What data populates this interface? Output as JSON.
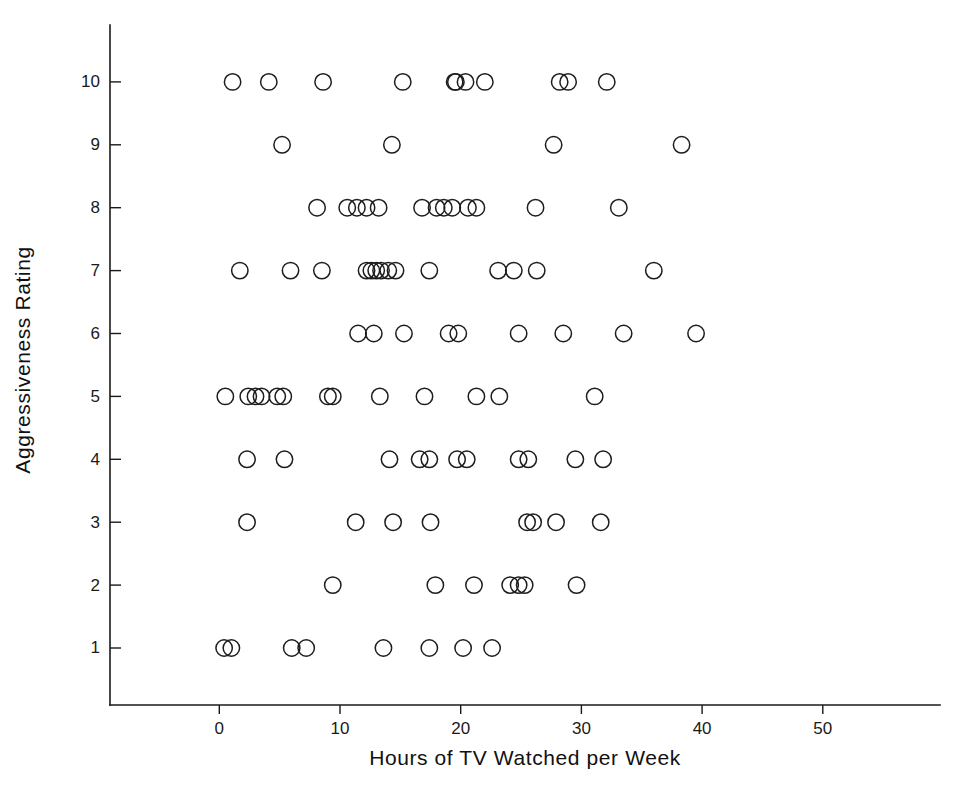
{
  "chart_data": {
    "type": "scatter",
    "title": "",
    "xlabel": "Hours of TV Watched per Week",
    "ylabel": "Aggressiveness Rating",
    "xlim": [
      -5,
      58
    ],
    "ylim": [
      0.2,
      11.2
    ],
    "grid": false,
    "legend": null,
    "marker": "open-circle",
    "marker_color": "#1d1d1d",
    "xticks": [
      0,
      10,
      20,
      30,
      40,
      50
    ],
    "xtick_labels": [
      "0",
      "10",
      "20",
      "30",
      "40",
      "50"
    ],
    "yticks": [
      1,
      2,
      3,
      4,
      5,
      6,
      7,
      8,
      9,
      10
    ],
    "ytick_labels": [
      "1",
      "2",
      "3",
      "4",
      "5",
      "6",
      "7",
      "8",
      "9",
      "10"
    ],
    "series": [
      {
        "name": "participants",
        "points": [
          [
            1.1,
            10
          ],
          [
            4.1,
            10
          ],
          [
            8.6,
            10
          ],
          [
            15.2,
            10
          ],
          [
            19.5,
            10
          ],
          [
            19.6,
            10
          ],
          [
            20.4,
            10
          ],
          [
            22.0,
            10
          ],
          [
            28.2,
            10
          ],
          [
            28.9,
            10
          ],
          [
            32.1,
            10
          ],
          [
            5.2,
            9
          ],
          [
            14.3,
            9
          ],
          [
            27.7,
            9
          ],
          [
            38.3,
            9
          ],
          [
            8.1,
            8
          ],
          [
            10.6,
            8
          ],
          [
            11.4,
            8
          ],
          [
            12.2,
            8
          ],
          [
            13.2,
            8
          ],
          [
            16.8,
            8
          ],
          [
            18.0,
            8
          ],
          [
            18.6,
            8
          ],
          [
            19.3,
            8
          ],
          [
            20.6,
            8
          ],
          [
            21.3,
            8
          ],
          [
            26.2,
            8
          ],
          [
            33.1,
            8
          ],
          [
            1.7,
            7
          ],
          [
            5.9,
            7
          ],
          [
            8.5,
            7
          ],
          [
            12.2,
            7
          ],
          [
            12.6,
            7
          ],
          [
            13.0,
            7
          ],
          [
            13.4,
            7
          ],
          [
            14.0,
            7
          ],
          [
            14.6,
            7
          ],
          [
            17.4,
            7
          ],
          [
            23.1,
            7
          ],
          [
            24.4,
            7
          ],
          [
            26.3,
            7
          ],
          [
            36.0,
            7
          ],
          [
            11.5,
            6
          ],
          [
            12.8,
            6
          ],
          [
            15.3,
            6
          ],
          [
            19.0,
            6
          ],
          [
            19.8,
            6
          ],
          [
            24.8,
            6
          ],
          [
            28.5,
            6
          ],
          [
            33.5,
            6
          ],
          [
            39.5,
            6
          ],
          [
            0.5,
            5
          ],
          [
            2.4,
            5
          ],
          [
            3.0,
            5
          ],
          [
            3.5,
            5
          ],
          [
            4.8,
            5
          ],
          [
            5.3,
            5
          ],
          [
            9.0,
            5
          ],
          [
            9.4,
            5
          ],
          [
            13.3,
            5
          ],
          [
            17.0,
            5
          ],
          [
            21.3,
            5
          ],
          [
            23.2,
            5
          ],
          [
            31.1,
            5
          ],
          [
            2.3,
            4
          ],
          [
            5.4,
            4
          ],
          [
            14.1,
            4
          ],
          [
            16.6,
            4
          ],
          [
            17.4,
            4
          ],
          [
            19.7,
            4
          ],
          [
            20.5,
            4
          ],
          [
            24.8,
            4
          ],
          [
            25.6,
            4
          ],
          [
            29.5,
            4
          ],
          [
            31.8,
            4
          ],
          [
            2.3,
            3
          ],
          [
            11.3,
            3
          ],
          [
            14.4,
            3
          ],
          [
            17.5,
            3
          ],
          [
            25.5,
            3
          ],
          [
            26.0,
            3
          ],
          [
            27.9,
            3
          ],
          [
            31.6,
            3
          ],
          [
            9.4,
            2
          ],
          [
            17.9,
            2
          ],
          [
            21.1,
            2
          ],
          [
            24.1,
            2
          ],
          [
            24.8,
            2
          ],
          [
            25.3,
            2
          ],
          [
            29.6,
            2
          ],
          [
            0.4,
            1
          ],
          [
            1.0,
            1
          ],
          [
            6.0,
            1
          ],
          [
            7.2,
            1
          ],
          [
            13.6,
            1
          ],
          [
            17.4,
            1
          ],
          [
            20.2,
            1
          ],
          [
            22.6,
            1
          ]
        ]
      }
    ]
  }
}
